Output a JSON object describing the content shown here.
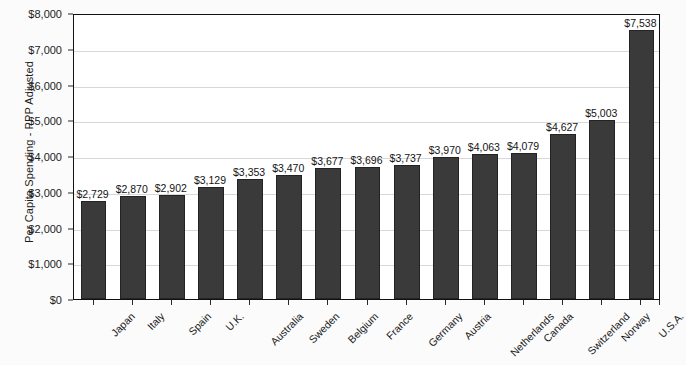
{
  "chart_data": {
    "type": "bar",
    "title": "",
    "xlabel": "",
    "ylabel": "Per Capita Spending - PPP Adjusted",
    "ylim": [
      0,
      8000
    ],
    "ytick_step": 1000,
    "grid": true,
    "legend": "none",
    "orientation": "vertical",
    "sorted": "ascending",
    "categories": [
      "Japan",
      "Italy",
      "Spain",
      "U.K.",
      "Australia",
      "Sweden",
      "Belgium",
      "France",
      "Germany",
      "Austria",
      "Netherlands",
      "Canada",
      "Switzerland",
      "Norway",
      "U.S.A."
    ],
    "values": [
      2729,
      2870,
      2902,
      3129,
      3353,
      3470,
      3677,
      3696,
      3737,
      3970,
      4063,
      4079,
      4627,
      5003,
      7538
    ],
    "value_labels": [
      "$2,729",
      "$2,870",
      "$2,902",
      "$3,129",
      "$3,353",
      "$3,470",
      "$3,677",
      "$3,696",
      "$3,737",
      "$3,970",
      "$4,063",
      "$4,079",
      "$4,627",
      "$5,003",
      "$7,538"
    ],
    "ytick_labels": [
      "$0",
      "$1,000",
      "$2,000",
      "$3,000",
      "$4,000",
      "$5,000",
      "$6,000",
      "$7,000",
      "$8,000"
    ],
    "ytick_values": [
      0,
      1000,
      2000,
      3000,
      4000,
      5000,
      6000,
      7000,
      8000
    ],
    "colors": {
      "bar_fill": "#3a3a3a",
      "bar_stroke": "#232323",
      "gridline": "#d8d8d8",
      "axis": "#111111",
      "plot_background": "#ffffff",
      "page_background": "#fbfbfb",
      "text": "#1a1a1a"
    }
  }
}
